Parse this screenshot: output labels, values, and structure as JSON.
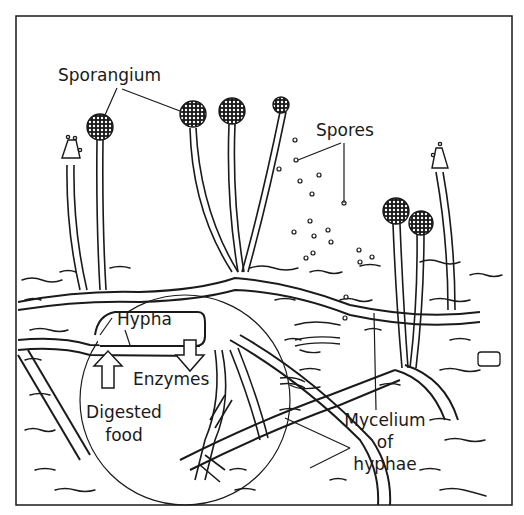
{
  "diagram": {
    "labels": {
      "sporangium": "Sporangium",
      "spores": "Spores",
      "hypha": "Hypha",
      "enzymes": "Enzymes",
      "digested_food_line1": "Digested",
      "digested_food_line2": "food",
      "mycelium_line1": "Mycelium",
      "mycelium_line2": "of",
      "mycelium_line3": "hyphae"
    },
    "colors": {
      "ink": "#1a1a1a",
      "background": "#ffffff"
    }
  }
}
